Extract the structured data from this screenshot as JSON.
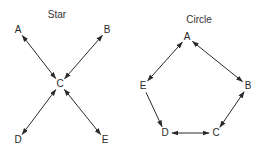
{
  "diagrams": [
    {
      "title": "Star",
      "title_pos": [
        57,
        15
      ],
      "nodes": [
        {
          "id": "A",
          "label": "A",
          "pos": [
            18,
            30
          ]
        },
        {
          "id": "B",
          "label": "B",
          "pos": [
            107,
            30
          ]
        },
        {
          "id": "C",
          "label": "C",
          "pos": [
            60,
            84
          ]
        },
        {
          "id": "D",
          "label": "D",
          "pos": [
            18,
            140
          ]
        },
        {
          "id": "E",
          "label": "E",
          "pos": [
            105,
            140
          ]
        }
      ],
      "edges": [
        {
          "from": "A",
          "to": "C",
          "bidirectional": true
        },
        {
          "from": "B",
          "to": "C",
          "bidirectional": true
        },
        {
          "from": "C",
          "to": "D",
          "bidirectional": true
        },
        {
          "from": "C",
          "to": "E",
          "bidirectional": true
        }
      ]
    },
    {
      "title": "Circle",
      "title_pos": [
        199,
        20
      ],
      "nodes": [
        {
          "id": "A",
          "label": "A",
          "pos": [
            187,
            37
          ]
        },
        {
          "id": "B",
          "label": "B",
          "pos": [
            248,
            86
          ]
        },
        {
          "id": "C",
          "label": "C",
          "pos": [
            216,
            133
          ]
        },
        {
          "id": "D",
          "label": "D",
          "pos": [
            165,
            133
          ]
        },
        {
          "id": "E",
          "label": "E",
          "pos": [
            143,
            86
          ]
        }
      ],
      "edges": [
        {
          "from": "A",
          "to": "B",
          "bidirectional": true
        },
        {
          "from": "B",
          "to": "C",
          "bidirectional": true
        },
        {
          "from": "C",
          "to": "D",
          "bidirectional": true
        },
        {
          "from": "E",
          "to": "D",
          "bidirectional": false
        },
        {
          "from": "A",
          "to": "E",
          "bidirectional": true
        }
      ]
    }
  ],
  "colors": {
    "stroke": "#2a2a2a",
    "text": "#2a2a2a",
    "background": "#ffffff"
  }
}
